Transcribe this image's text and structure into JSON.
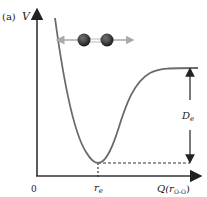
{
  "panel_label": "(a)",
  "y_axis_label": "V",
  "x_axis_label": "Q(r",
  "x_axis_subscript": "O-O",
  "x_axis_close": ")",
  "origin_label": "0",
  "min_label": "r",
  "min_subscript": "e",
  "depth_label": "D",
  "depth_subscript": "e",
  "colors": {
    "curve": "#6b6b6b",
    "axis": "#333333",
    "atom": "#333333",
    "arrow_grey": "#aaaaaa"
  },
  "molecule": {
    "type": "diatomic",
    "atoms": [
      "O",
      "O"
    ],
    "motion": "stretch"
  }
}
